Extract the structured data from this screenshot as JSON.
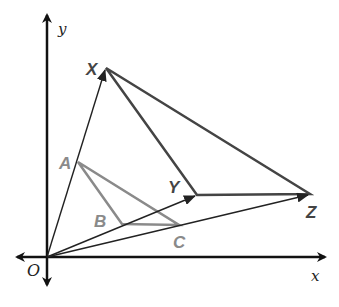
{
  "diagram": {
    "axes": {
      "x_label": "x",
      "y_label": "y",
      "origin_label": "O"
    },
    "points": {
      "X": {
        "label": "X",
        "x": 106,
        "y": 68
      },
      "Y": {
        "label": "Y",
        "x": 197,
        "y": 195
      },
      "Z": {
        "label": "Z",
        "x": 310,
        "y": 194
      },
      "A": {
        "label": "A",
        "x": 78,
        "y": 162
      },
      "B": {
        "label": "B",
        "x": 122,
        "y": 224
      },
      "C": {
        "label": "C",
        "x": 179,
        "y": 225
      }
    },
    "triangles": [
      {
        "name": "XYZ",
        "vertices": [
          "X",
          "Y",
          "Z"
        ],
        "color": "#444444"
      },
      {
        "name": "ABC",
        "vertices": [
          "A",
          "B",
          "C"
        ],
        "color": "#8a8a8a"
      }
    ],
    "vectors": [
      {
        "from": "O",
        "to": "X"
      },
      {
        "from": "O",
        "to": "Y"
      },
      {
        "from": "O",
        "to": "Z"
      }
    ],
    "colors": {
      "axis": "#111111",
      "image_triangle": "#444444",
      "preimage_triangle": "#8a8a8a",
      "vector": "#222222"
    }
  }
}
